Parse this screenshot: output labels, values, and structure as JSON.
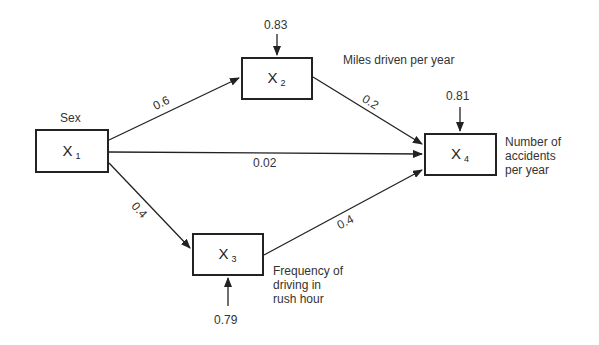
{
  "diagram": {
    "type": "path-diagram",
    "nodes": [
      {
        "id": "x1",
        "symbol": "X",
        "subscript": "1",
        "label": "Sex"
      },
      {
        "id": "x2",
        "symbol": "X",
        "subscript": "2",
        "label": "Miles driven per year",
        "residual": "0.83"
      },
      {
        "id": "x3",
        "symbol": "X",
        "subscript": "3",
        "label_lines": [
          "Frequency of",
          "driving in",
          "rush hour"
        ],
        "residual": "0.79"
      },
      {
        "id": "x4",
        "symbol": "X",
        "subscript": "4",
        "label_lines": [
          "Number of",
          "accidents",
          "per year"
        ],
        "residual": "0.81"
      }
    ],
    "edges": [
      {
        "from": "x1",
        "to": "x2",
        "coefficient": "0.6"
      },
      {
        "from": "x1",
        "to": "x4",
        "coefficient": "0.02"
      },
      {
        "from": "x1",
        "to": "x3",
        "coefficient": "0.4"
      },
      {
        "from": "x2",
        "to": "x4",
        "coefficient": "0.2"
      },
      {
        "from": "x3",
        "to": "x4",
        "coefficient": "0.4"
      }
    ]
  }
}
